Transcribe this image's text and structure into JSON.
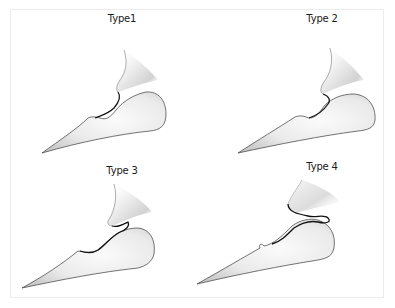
{
  "figure": {
    "panels": [
      {
        "id": "type1",
        "label": "Type1"
      },
      {
        "id": "type2",
        "label": "Type 2"
      },
      {
        "id": "type3",
        "label": "Type 3"
      },
      {
        "id": "type4",
        "label": "Type 4"
      }
    ],
    "colors": {
      "fill_light": "#f4f4f4",
      "fill_shade": "#c8c8c8",
      "outline": "#3a3a3a",
      "contact_line": "#111111",
      "frame_border": "#ececec"
    }
  }
}
